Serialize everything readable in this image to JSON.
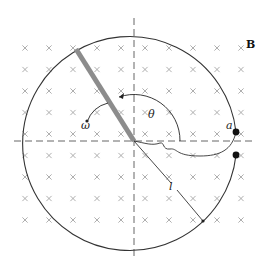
{
  "diagram": {
    "field": {
      "label": "B",
      "direction": "into-page",
      "symbol": "cross-icon",
      "grid_columns": 10,
      "grid_rows": 9
    },
    "labels": {
      "angular_velocity": "ω",
      "angle": "θ",
      "rod_length": "l",
      "contact_point": "a"
    },
    "colors": {
      "rod": "#8c8c8c",
      "circle": "#333333",
      "crosses": "#9a9a9a",
      "dashes": "#555555",
      "dots": "#111111"
    }
  }
}
